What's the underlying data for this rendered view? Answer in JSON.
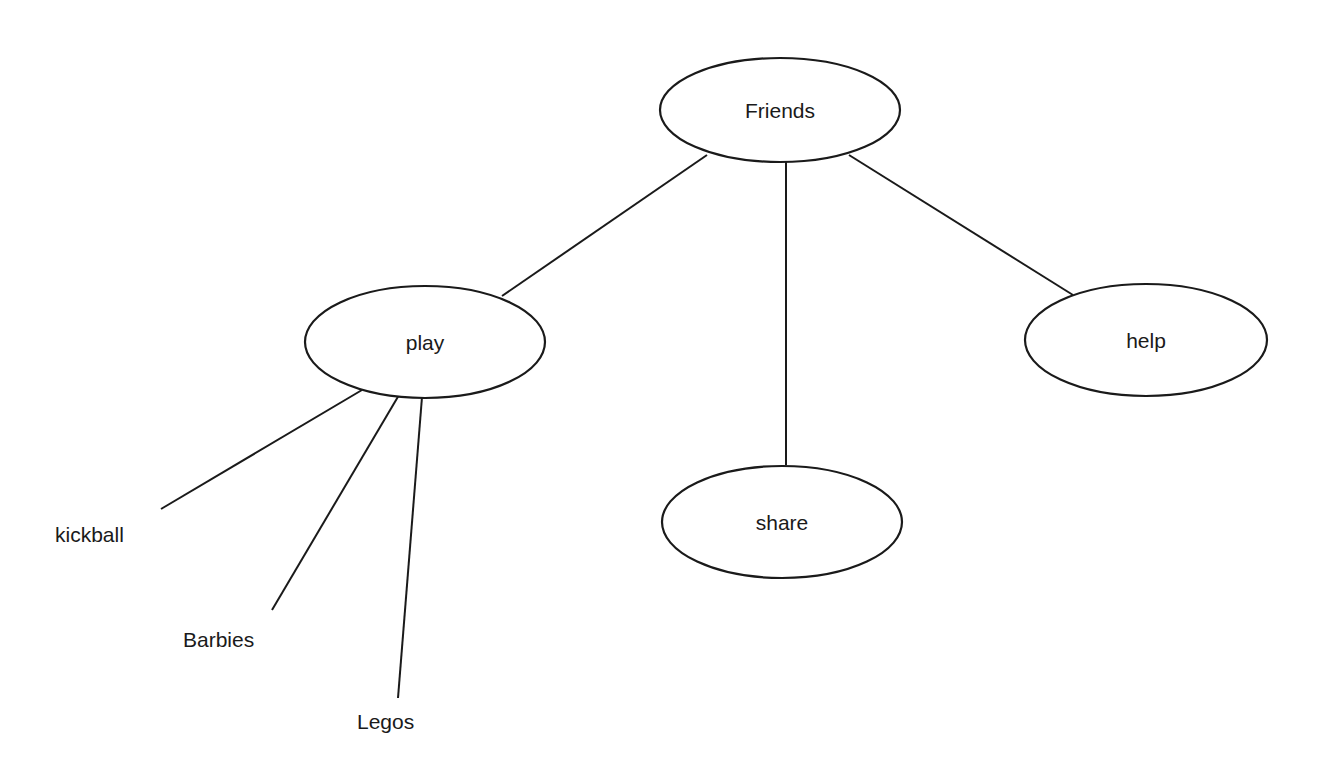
{
  "diagram": {
    "type": "concept-map",
    "root": "Friends",
    "colors": {
      "stroke": "#1a1a1a",
      "background": "#ffffff",
      "text": "#1a1a1a"
    },
    "nodes": [
      {
        "id": "friends",
        "label": "Friends",
        "shape": "ellipse",
        "cx": 780,
        "cy": 110,
        "rx": 120,
        "ry": 52
      },
      {
        "id": "play",
        "label": "play",
        "shape": "ellipse",
        "cx": 425,
        "cy": 342,
        "rx": 120,
        "ry": 56
      },
      {
        "id": "share",
        "label": "share",
        "shape": "ellipse",
        "cx": 782,
        "cy": 522,
        "rx": 120,
        "ry": 56
      },
      {
        "id": "help",
        "label": "help",
        "shape": "ellipse",
        "cx": 1146,
        "cy": 340,
        "rx": 121,
        "ry": 56
      }
    ],
    "leaves": [
      {
        "id": "kickball",
        "label": "kickball",
        "x": 55,
        "y": 542
      },
      {
        "id": "barbies",
        "label": "Barbies",
        "x": 183,
        "y": 647
      },
      {
        "id": "legos",
        "label": "Legos",
        "x": 357,
        "y": 729
      }
    ],
    "edges": [
      {
        "from": "friends",
        "to": "play",
        "x1": 707,
        "y1": 155,
        "x2": 502,
        "y2": 296
      },
      {
        "from": "friends",
        "to": "share",
        "x1": 786,
        "y1": 162,
        "x2": 786,
        "y2": 465
      },
      {
        "from": "friends",
        "to": "help",
        "x1": 849,
        "y1": 155,
        "x2": 1073,
        "y2": 295
      },
      {
        "from": "play",
        "to": "kickball",
        "x1": 362,
        "y1": 390,
        "x2": 161,
        "y2": 509
      },
      {
        "from": "play",
        "to": "barbies",
        "x1": 399,
        "y1": 395,
        "x2": 272,
        "y2": 610
      },
      {
        "from": "play",
        "to": "legos",
        "x1": 422,
        "y1": 397,
        "x2": 398,
        "y2": 698
      }
    ]
  }
}
